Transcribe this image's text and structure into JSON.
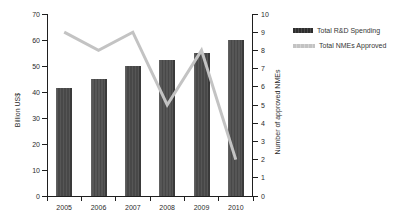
{
  "chart_data": {
    "type": "combo",
    "categories": [
      "2005",
      "2006",
      "2007",
      "2008",
      "2009",
      "2010"
    ],
    "series": [
      {
        "name": "Total R&D Spending",
        "type": "bar",
        "axis": "left",
        "values": [
          41.5,
          45,
          50,
          52.5,
          55,
          60
        ]
      },
      {
        "name": "Total NMEs Approved",
        "type": "line",
        "axis": "right",
        "values": [
          9,
          8,
          9,
          5,
          8,
          2
        ]
      }
    ],
    "left_axis": {
      "label": "Billion US$",
      "min": 0,
      "max": 70,
      "step": 10
    },
    "right_axis": {
      "label": "Number of approved NMEs",
      "min": 0,
      "max": 10,
      "step": 1
    },
    "x_axis": {
      "tick_style": "category-boundaries"
    },
    "grid": false,
    "legend_position": "right"
  },
  "colors": {
    "bar_fill": "#565656",
    "bar_stripe": "#484848",
    "bar_edge": "#3a3a3a",
    "line": "#c3c3c3",
    "axis": "#1f1f1f",
    "text": "#2b2b2b"
  }
}
